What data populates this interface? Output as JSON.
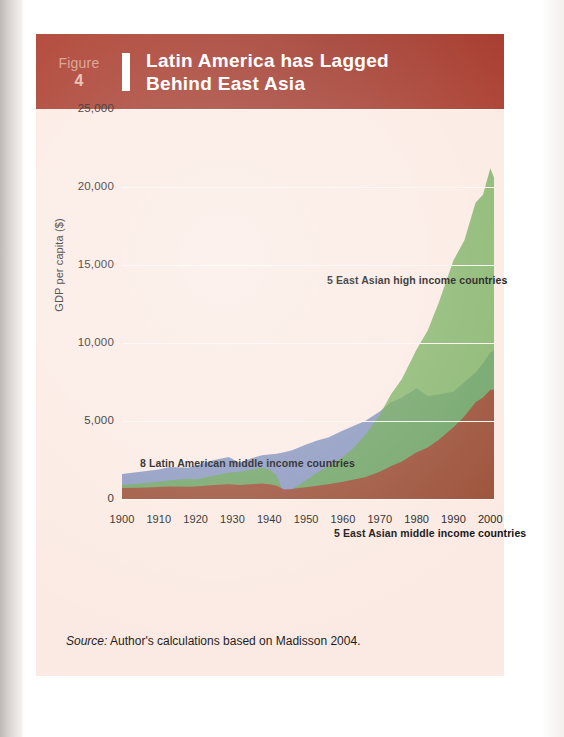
{
  "figure": {
    "label": "Figure",
    "number": "4",
    "title_line1": "Latin America has Lagged",
    "title_line2": "Behind East Asia",
    "header_color": "#a8392a",
    "panel_color": "#fbeae3"
  },
  "source": {
    "prefix": "Source:",
    "text": "Author's calculations based on Madisson 2004."
  },
  "chart_data": {
    "type": "area",
    "title": "Latin America has Lagged Behind East Asia",
    "xlabel": "",
    "ylabel": "GDP per capita ($)",
    "xlim": [
      1900,
      2001
    ],
    "ylim": [
      0,
      25000
    ],
    "grid": true,
    "legend": "inline-annotations",
    "overlap": "overlapping-translucent",
    "yticks": [
      "0",
      "5,000",
      "10,000",
      "15,000",
      "20,000",
      "25,000"
    ],
    "ytick_values": [
      0,
      5000,
      10000,
      15000,
      20000,
      25000
    ],
    "xticks": [
      "1900",
      "1910",
      "1920",
      "1930",
      "1940",
      "1950",
      "1960",
      "1970",
      "1980",
      "1990",
      "2000"
    ],
    "xtick_values": [
      1900,
      1910,
      1920,
      1930,
      1940,
      1950,
      1960,
      1970,
      1980,
      1990,
      2000
    ],
    "x": [
      1900,
      1905,
      1910,
      1913,
      1918,
      1920,
      1925,
      1929,
      1932,
      1935,
      1938,
      1940,
      1942,
      1944,
      1946,
      1948,
      1950,
      1953,
      1956,
      1960,
      1963,
      1966,
      1970,
      1973,
      1976,
      1980,
      1983,
      1986,
      1990,
      1993,
      1996,
      1998,
      2000,
      2001
    ],
    "series": [
      {
        "name": "8 Latin American middle income countries",
        "color": "#6b7fb5",
        "annotation": "8 Latin American middle income countries",
        "values": [
          1600,
          1750,
          1900,
          2050,
          2000,
          2150,
          2500,
          2700,
          2300,
          2600,
          2800,
          2850,
          2900,
          3000,
          3100,
          3300,
          3500,
          3750,
          3950,
          4400,
          4700,
          5000,
          5600,
          6200,
          6500,
          7100,
          6600,
          6700,
          6900,
          7500,
          8100,
          8700,
          9400,
          9500
        ]
      },
      {
        "name": "5 East Asian high income countries",
        "color": "#6aa84f",
        "annotation": "5 East Asian high income countries",
        "values": [
          900,
          1000,
          1100,
          1200,
          1300,
          1250,
          1500,
          1700,
          1750,
          1900,
          2000,
          1900,
          1500,
          300,
          600,
          900,
          1200,
          1700,
          2100,
          2700,
          3300,
          4100,
          5400,
          6700,
          7700,
          9600,
          10800,
          12600,
          15300,
          16600,
          19000,
          19500,
          21200,
          20600
        ]
      },
      {
        "name": "5 East Asian middle income countries",
        "color": "#a8392a",
        "annotation": "5 East Asian middle income countries",
        "values": [
          700,
          720,
          760,
          800,
          780,
          800,
          900,
          950,
          900,
          950,
          1000,
          950,
          850,
          600,
          650,
          700,
          750,
          850,
          950,
          1100,
          1250,
          1400,
          1750,
          2100,
          2400,
          3000,
          3300,
          3800,
          4600,
          5300,
          6200,
          6500,
          7000,
          7000
        ]
      }
    ]
  }
}
